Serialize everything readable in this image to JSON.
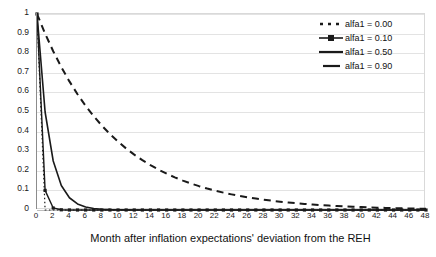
{
  "chart_data": {
    "type": "line",
    "title": "",
    "xlabel": "Month after inflation expectations' deviation from the REH",
    "ylabel": "",
    "xlim": [
      0,
      48
    ],
    "ylim": [
      0,
      1
    ],
    "grid": true,
    "legend_position": "top-right",
    "x_ticks": [
      0,
      2,
      4,
      6,
      8,
      10,
      12,
      14,
      16,
      18,
      20,
      22,
      24,
      26,
      28,
      30,
      32,
      34,
      36,
      38,
      40,
      42,
      44,
      46,
      48
    ],
    "y_ticks": [
      "0",
      "0.1",
      "0.2",
      "0.3",
      "0.4",
      "0.5",
      "0.6",
      "0.7",
      "0.8",
      "0.9",
      "1"
    ],
    "x": [
      0,
      1,
      2,
      3,
      4,
      5,
      6,
      7,
      8,
      9,
      10,
      11,
      12,
      13,
      14,
      15,
      16,
      17,
      18,
      19,
      20,
      21,
      22,
      23,
      24,
      25,
      26,
      27,
      28,
      29,
      30,
      31,
      32,
      33,
      34,
      35,
      36,
      37,
      38,
      39,
      40,
      41,
      42,
      43,
      44,
      45,
      46,
      47,
      48
    ],
    "series": [
      {
        "name": "alfa1 = 0.00",
        "style": "dotted",
        "color": "#1a1a1a",
        "alfa1": 0.0,
        "values": [
          1,
          0,
          0,
          0,
          0,
          0,
          0,
          0,
          0,
          0,
          0,
          0,
          0,
          0,
          0,
          0,
          0,
          0,
          0,
          0,
          0,
          0,
          0,
          0,
          0,
          0,
          0,
          0,
          0,
          0,
          0,
          0,
          0,
          0,
          0,
          0,
          0,
          0,
          0,
          0,
          0,
          0,
          0,
          0,
          0,
          0,
          0,
          0,
          0
        ]
      },
      {
        "name": "alfa1 = 0.10",
        "style": "solid-marker",
        "color": "#1a1a1a",
        "alfa1": 0.1,
        "values": [
          1,
          0.1,
          0.01,
          0.001,
          0.0001,
          1e-05,
          0,
          0,
          0,
          0,
          0,
          0,
          0,
          0,
          0,
          0,
          0,
          0,
          0,
          0,
          0,
          0,
          0,
          0,
          0,
          0,
          0,
          0,
          0,
          0,
          0,
          0,
          0,
          0,
          0,
          0,
          0,
          0,
          0,
          0,
          0,
          0,
          0,
          0,
          0,
          0,
          0,
          0,
          0
        ]
      },
      {
        "name": "alfa1 = 0.50",
        "style": "solid",
        "color": "#1a1a1a",
        "alfa1": 0.5,
        "values": [
          1,
          0.5,
          0.25,
          0.125,
          0.0625,
          0.03125,
          0.015625,
          0.0078125,
          0.00390625,
          0.001953,
          0.000977,
          0.000488,
          0.000244,
          0.000122,
          6.1e-05,
          3e-05,
          1.5e-05,
          8e-06,
          4e-06,
          2e-06,
          1e-06,
          0,
          0,
          0,
          0,
          0,
          0,
          0,
          0,
          0,
          0,
          0,
          0,
          0,
          0,
          0,
          0,
          0,
          0,
          0,
          0,
          0,
          0,
          0,
          0,
          0,
          0,
          0,
          0
        ]
      },
      {
        "name": "alfa1 = 0.90",
        "style": "dashed",
        "color": "#1a1a1a",
        "alfa1": 0.9,
        "values": [
          1,
          0.9,
          0.81,
          0.729,
          0.6561,
          0.5905,
          0.5314,
          0.4783,
          0.4305,
          0.3874,
          0.3487,
          0.3138,
          0.2824,
          0.2542,
          0.2288,
          0.2059,
          0.1853,
          0.1668,
          0.1501,
          0.1351,
          0.1216,
          0.1094,
          0.0985,
          0.0886,
          0.0798,
          0.0718,
          0.0646,
          0.0581,
          0.0523,
          0.0471,
          0.0424,
          0.0382,
          0.0343,
          0.0309,
          0.0278,
          0.025,
          0.0225,
          0.0203,
          0.0182,
          0.0164,
          0.0148,
          0.0133,
          0.012,
          0.0108,
          0.0097,
          0.0087,
          0.0079,
          0.0071,
          0.0064
        ]
      }
    ]
  },
  "legend": {
    "items": [
      {
        "label": "alfa1 = 0.00",
        "sample": "dotted-line-sample"
      },
      {
        "label": "alfa1 = 0.10",
        "sample": "line-with-marker-sample"
      },
      {
        "label": "alfa1 = 0.50",
        "sample": "solid-line-sample"
      },
      {
        "label": "alfa1 = 0.90",
        "sample": "dashed-line-sample"
      }
    ]
  },
  "colors": {
    "line": "#1a1a1a",
    "gridline": "#e3e3e3",
    "axis": "#8c8c8c",
    "background": "#ffffff"
  }
}
